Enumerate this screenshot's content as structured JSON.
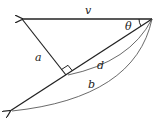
{
  "diagram": {
    "labels": {
      "v": "v",
      "theta": "θ",
      "a": "a",
      "d": "d",
      "b": "b"
    },
    "colors": {
      "stroke": "#222222",
      "background": "#ffffff"
    }
  }
}
